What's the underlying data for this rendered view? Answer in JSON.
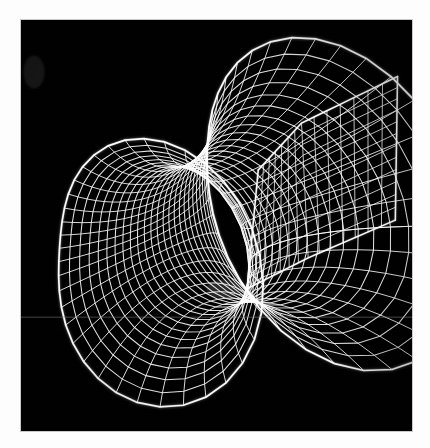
{
  "figure": {
    "subject_name": "saddle-tunnel minimal surface",
    "render_style": "wireframe",
    "background_color": "#000000",
    "border_color": "#fdfdfd",
    "wire_color": "#ffffff",
    "canvas": {
      "x": 21,
      "y": 20,
      "width": 391,
      "height": 411
    },
    "image_size": {
      "width": 430,
      "height": 448
    },
    "artifacts": {
      "horizontal_scanline": "faint grey horizontal line across lower third",
      "compression": "soft jpeg-like blur on mesh lines"
    },
    "visible_text": ""
  },
  "chart_data": {
    "type": "line",
    "xlabel": "",
    "ylabel": "",
    "grid": false,
    "legend_position": "none",
    "parts": [
      {
        "name": "upper-lobe",
        "u_lines": 22,
        "v_lines": 16,
        "tip_point": [
          30,
          70
        ]
      },
      {
        "name": "central-waist",
        "saddle_point": [
          215,
          285
        ]
      },
      {
        "name": "lower-lobe",
        "u_lines": 22,
        "v_lines": 16
      },
      {
        "name": "right-wing-panel",
        "u_lines": 14,
        "v_lines": 12
      }
    ],
    "surface": {
      "name": "saddle-tunnel minimal surface",
      "u_range": [
        -1.35,
        1.35
      ],
      "v_range": [
        0,
        6.283185
      ],
      "u_steps": 26,
      "v_steps": 36
    }
  }
}
